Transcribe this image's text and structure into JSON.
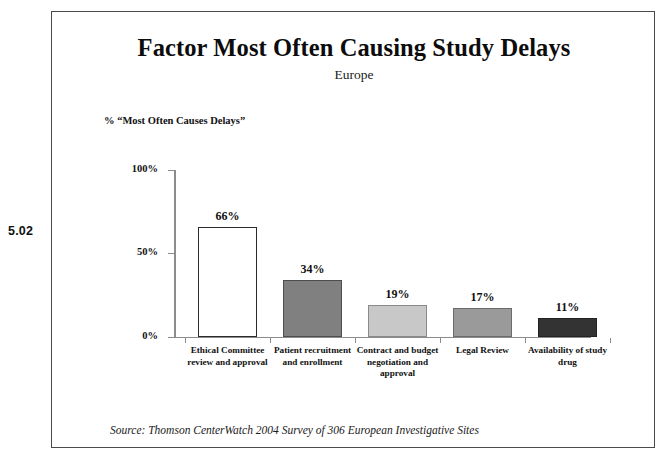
{
  "figure_number": "5.02",
  "source_note": "Source:  Thomson CenterWatch 2004 Survey of 306 European Investigative Sites",
  "chart_data": {
    "type": "bar",
    "title": "Factor Most Often Causing Study Delays",
    "subtitle": "Europe",
    "ylabel": "% “Most Often Causes Delays”",
    "xlabel": "",
    "ylim": [
      0,
      100
    ],
    "yticks": [
      0,
      50,
      100
    ],
    "ytick_labels": [
      "0%",
      "50%",
      "100%"
    ],
    "grid": false,
    "legend": "none",
    "categories": [
      "Ethical Committee review and approval",
      "Patient recruitment and enrollment",
      "Contract and budget negotiation and approval",
      "Legal Review",
      "Availability of study drug"
    ],
    "values": [
      66,
      34,
      19,
      17,
      11
    ],
    "value_labels": [
      "66%",
      "34%",
      "19%",
      "17%",
      "11%"
    ],
    "bar_colors": [
      "#ffffff",
      "#808080",
      "#c8c8c8",
      "#9a9a9a",
      "#333333"
    ],
    "bar_border_colors": [
      "#2b2b2b",
      "#4d4d4d",
      "#8a8a8a",
      "#6b6b6b",
      "#222222"
    ],
    "bars": [
      {
        "label": "Ethical Committee review and approval",
        "label_line1": "Ethical Committee",
        "label_line2": "review and approval",
        "label_line3": "",
        "value": 66,
        "value_label": "66%",
        "fill": "#ffffff",
        "stroke": "#2b2b2b"
      },
      {
        "label": "Patient recruitment and enrollment",
        "label_line1": "Patient recruitment",
        "label_line2": "and enrollment",
        "label_line3": "",
        "value": 34,
        "value_label": "34%",
        "fill": "#808080",
        "stroke": "#4d4d4d"
      },
      {
        "label": "Contract and budget negotiation and approval",
        "label_line1": "Contract and budget",
        "label_line2": "negotiation and",
        "label_line3": "approval",
        "value": 19,
        "value_label": "19%",
        "fill": "#c8c8c8",
        "stroke": "#8a8a8a"
      },
      {
        "label": "Legal Review",
        "label_line1": "Legal Review",
        "label_line2": "",
        "label_line3": "",
        "value": 17,
        "value_label": "17%",
        "fill": "#9a9a9a",
        "stroke": "#6b6b6b"
      },
      {
        "label": "Availability of study drug",
        "label_line1": "Availability of study",
        "label_line2": "drug",
        "label_line3": "",
        "value": 11,
        "value_label": "11%",
        "fill": "#333333",
        "stroke": "#222222"
      }
    ]
  }
}
